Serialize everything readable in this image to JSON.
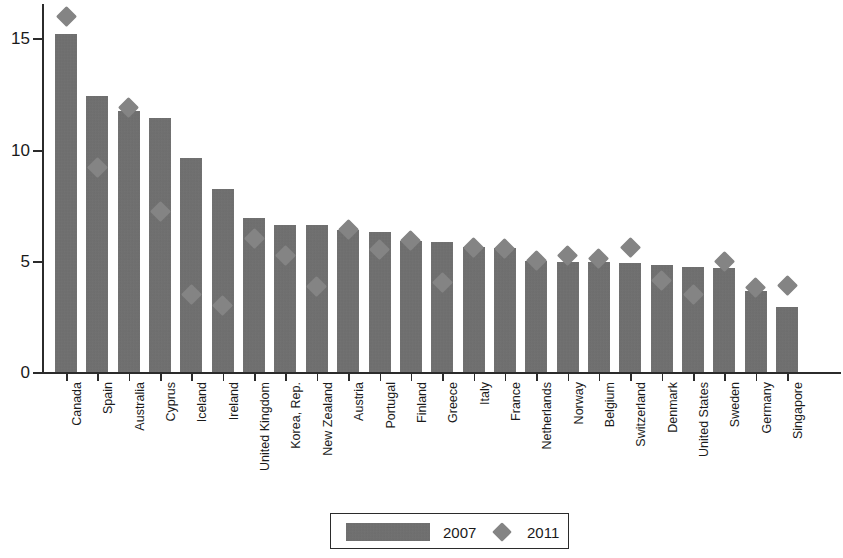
{
  "chart_data": {
    "type": "bar",
    "title": "",
    "subtitle": "",
    "xlabel": "",
    "ylabel": "",
    "ylim": [
      0,
      16.6
    ],
    "yticks": [
      0,
      5,
      10,
      15
    ],
    "ytick_labels": [
      "0",
      "5",
      "10",
      "15"
    ],
    "grid": false,
    "legend_position": "bottom-center",
    "categories": [
      "Canada",
      "Spain",
      "Australia",
      "Cyprus",
      "Iceland",
      "Ireland",
      "United Kingdom",
      "Korea, Rep.",
      "New Zealand",
      "Austria",
      "Portugal",
      "Finland",
      "Greece",
      "Italy",
      "France",
      "Netherlands",
      "Norway",
      "Belgium",
      "Switzerland",
      "Denmark",
      "United States",
      "Sweden",
      "Germany",
      "Singapore"
    ],
    "series": [
      {
        "name": "2007",
        "type": "bar",
        "color": "#6e6e6e",
        "values": [
          15.2,
          12.4,
          11.7,
          11.4,
          9.6,
          8.2,
          6.9,
          6.6,
          6.6,
          6.4,
          6.3,
          5.9,
          5.85,
          5.6,
          5.55,
          5.0,
          4.95,
          4.95,
          4.9,
          4.8,
          4.7,
          4.65,
          3.65,
          2.9
        ]
      },
      {
        "name": "2011",
        "type": "scatter",
        "marker": "diamond",
        "color": "#848484",
        "values": [
          15.95,
          9.2,
          11.9,
          7.2,
          3.5,
          3.0,
          6.0,
          5.25,
          3.85,
          6.4,
          5.5,
          5.9,
          4.0,
          5.6,
          5.55,
          5.0,
          5.25,
          5.1,
          5.6,
          4.1,
          3.5,
          4.95,
          3.8,
          3.9
        ]
      }
    ]
  },
  "legend": {
    "entries": [
      {
        "label": "2007",
        "swatch": "bar-swatch"
      },
      {
        "label": "2011",
        "swatch": "diamond-marker"
      }
    ]
  },
  "axes": {
    "y": {
      "tick_labels": [
        "15",
        "10",
        "5",
        "0"
      ]
    }
  }
}
